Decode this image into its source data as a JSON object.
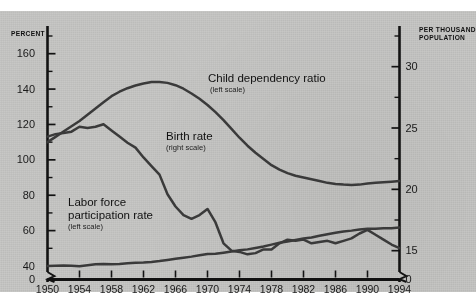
{
  "figure": {
    "background": "#c8c8c6",
    "line_color": "#3a3a3a",
    "axis_color": "#121212"
  },
  "axes": {
    "left_title_line1": "PERCENT",
    "right_title_line1": "PER THOUSAND",
    "right_title_line2": "POPULATION",
    "left_ticks": [
      "160",
      "140",
      "120",
      "100",
      "80",
      "60",
      "40",
      "0"
    ],
    "right_ticks": [
      "30",
      "25",
      "20",
      "15",
      "0"
    ],
    "x_ticks": [
      "1950",
      "1954",
      "1958",
      "1962",
      "1966",
      "1970",
      "1974",
      "1978",
      "1982",
      "1986",
      "1990",
      "1994"
    ]
  },
  "annotations": {
    "child": {
      "label": "Child dependency ratio",
      "scale": "(left scale)"
    },
    "birth": {
      "label": "Birth rate",
      "scale": "(right scale)"
    },
    "labor": {
      "label_line1": "Labor force",
      "label_line2": "participation rate",
      "scale": "(left scale)"
    }
  },
  "chart_data": {
    "type": "line",
    "title": "",
    "xlabel": "",
    "ylabel": "PERCENT",
    "y2label": "PER THOUSAND POPULATION",
    "grid": false,
    "legend": "inline-annotations",
    "xlim": [
      1950,
      1994
    ],
    "ylim": [
      40,
      170
    ],
    "y2lim": [
      13.75,
      32.5
    ],
    "left_axis_break_below": 40,
    "right_axis_break_below": 15,
    "x": [
      1950,
      1951,
      1952,
      1953,
      1954,
      1955,
      1956,
      1957,
      1958,
      1959,
      1960,
      1961,
      1962,
      1963,
      1964,
      1965,
      1966,
      1967,
      1968,
      1969,
      1970,
      1971,
      1972,
      1973,
      1974,
      1975,
      1976,
      1977,
      1978,
      1979,
      1980,
      1981,
      1982,
      1983,
      1984,
      1985,
      1986,
      1987,
      1988,
      1989,
      1990,
      1991,
      1992,
      1993,
      1994
    ],
    "series": [
      {
        "name": "Child dependency ratio",
        "axis": "left",
        "unit": "percent",
        "values": [
          110,
          113,
          116,
          119,
          122,
          125.5,
          129,
          132.5,
          136,
          138.5,
          140.5,
          142,
          143.2,
          144,
          144,
          143.5,
          142.2,
          140.2,
          137.5,
          134.5,
          131,
          127,
          122.5,
          117.5,
          112.5,
          108,
          104,
          100.5,
          97,
          94.5,
          92.5,
          91,
          90,
          89,
          88,
          87,
          86.4,
          86,
          85.8,
          86,
          86.6,
          87,
          87.3,
          87.6,
          88
        ]
      },
      {
        "name": "Birth rate",
        "axis": "right",
        "unit": "per thousand population",
        "values": [
          24.3,
          24.5,
          24.6,
          24.7,
          25.1,
          25.0,
          25.1,
          25.3,
          24.8,
          24.3,
          23.8,
          23.4,
          22.6,
          21.9,
          21.2,
          19.6,
          18.6,
          17.9,
          17.6,
          17.9,
          18.4,
          17.3,
          15.6,
          15.0,
          14.9,
          14.7,
          14.8,
          15.1,
          15.1,
          15.6,
          15.9,
          15.8,
          15.9,
          15.6,
          15.7,
          15.8,
          15.6,
          15.8,
          16.0,
          16.4,
          16.7,
          16.3,
          15.9,
          15.5,
          15.2
        ]
      },
      {
        "name": "Labor force participation rate",
        "axis": "left",
        "unit": "percent",
        "values": [
          40.0,
          40.2,
          40.3,
          40.1,
          39.9,
          40.4,
          41.0,
          41.1,
          41.0,
          41.1,
          41.5,
          41.9,
          42.0,
          42.3,
          42.8,
          43.4,
          44.1,
          44.7,
          45.3,
          46.1,
          46.8,
          46.9,
          47.5,
          48.2,
          48.9,
          49.4,
          50.2,
          51.0,
          52.1,
          53.1,
          53.9,
          54.7,
          55.6,
          56.1,
          57.1,
          58.0,
          58.8,
          59.5,
          60.0,
          60.6,
          61.0,
          61.1,
          61.3,
          61.4,
          61.7
        ]
      }
    ]
  }
}
